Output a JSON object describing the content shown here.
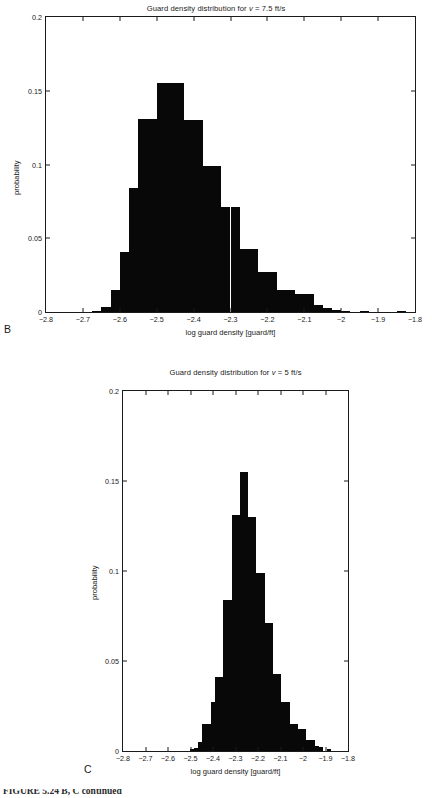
{
  "figure": {
    "caption_partial": "FIGURE 5.24  B, C continued"
  },
  "panels": [
    {
      "letter": "B",
      "title_prefix": "Guard density distribution for ",
      "title_var": "v",
      "title_suffix": " = 7.5 ft/s",
      "xlabel": "log guard density [guard/ft]",
      "ylabel": "probability"
    },
    {
      "letter": "C",
      "title_prefix": "Guard density distribution for ",
      "title_var": "v",
      "title_suffix": " = 5 ft/s",
      "xlabel": "log guard density [guard/ft]",
      "ylabel": "probability"
    }
  ],
  "chart_data": [
    {
      "type": "bar",
      "panel": "B",
      "title": "Guard density distribution for v = 7.5 ft/s",
      "xlabel": "log guard density [guard/ft]",
      "ylabel": "probability",
      "xlim": [
        -2.8,
        -1.8
      ],
      "ylim": [
        0,
        0.2
      ],
      "xticks": [
        -2.8,
        -2.7,
        -2.6,
        -2.5,
        -2.4,
        -2.3,
        -2.2,
        -2.1,
        -2.0,
        -1.9,
        -1.8
      ],
      "xtick_labels": [
        "−2.8",
        "−2.7",
        "−2.6",
        "−2.5",
        "−2.4",
        "−2.3",
        "−2.2",
        "−2.1",
        "−2",
        "−1.9",
        "−1.8"
      ],
      "yticks": [
        0,
        0.05,
        0.1,
        0.15,
        0.2
      ],
      "ytick_labels": [
        "0",
        "0.05",
        "0.1",
        "0.15",
        "0.2"
      ],
      "grid": false,
      "bin_width": 0.025,
      "bin_centers": [
        -2.6625,
        -2.6375,
        -2.6125,
        -2.5875,
        -2.5625,
        -2.5375,
        -2.5125,
        -2.4875,
        -2.4625,
        -2.4375,
        -2.4125,
        -2.3875,
        -2.3625,
        -2.3375,
        -2.3125,
        -2.2875,
        -2.2625,
        -2.2375,
        -2.2125,
        -2.1875,
        -2.1625,
        -2.1375,
        -2.1125,
        -2.0875,
        -2.0625,
        -2.0375,
        -2.0125,
        -1.9875,
        -1.9375,
        -1.8375
      ],
      "values": [
        0.001,
        0.0035,
        0.015,
        0.041,
        0.084,
        0.131,
        0.131,
        0.155,
        0.155,
        0.155,
        0.13,
        0.13,
        0.099,
        0.099,
        0.071,
        0.071,
        0.043,
        0.043,
        0.027,
        0.027,
        0.015,
        0.015,
        0.012,
        0.012,
        0.005,
        0.003,
        0.0015,
        0.001,
        0.0006,
        0.0004
      ]
    },
    {
      "type": "bar",
      "panel": "C",
      "title": "Guard density distribution for v = 5 ft/s",
      "xlabel": "log guard density [guard/ft]",
      "ylabel": "probability",
      "xlim": [
        -2.8,
        -1.8
      ],
      "ylim": [
        0,
        0.2
      ],
      "xticks": [
        -2.8,
        -2.7,
        -2.6,
        -2.5,
        -2.4,
        -2.3,
        -2.2,
        -2.1,
        -2.0,
        -1.9,
        -1.8
      ],
      "xtick_labels": [
        "−2.8",
        "−2.7",
        "−2.6",
        "−2.5",
        "−2.4",
        "−2.3",
        "−2.2",
        "−2.1",
        "−2",
        "−1.9",
        "−1.8"
      ],
      "yticks": [
        0,
        0.05,
        0.1,
        0.15,
        0.2
      ],
      "ytick_labels": [
        "0",
        "0.05",
        "0.1",
        "0.15",
        "0.2"
      ],
      "grid": false,
      "bin_width": 0.0185,
      "bin_centers": [
        -2.4935,
        -2.475,
        -2.4565,
        -2.438,
        -2.4195,
        -2.401,
        -2.3825,
        -2.364,
        -2.3455,
        -2.327,
        -2.3085,
        -2.29,
        -2.2715,
        -2.253,
        -2.2345,
        -2.216,
        -2.1975,
        -2.179,
        -2.1605,
        -2.142,
        -2.1235,
        -2.105,
        -2.0865,
        -2.068,
        -2.0495,
        -2.031,
        -2.0125,
        -1.994,
        -1.9755,
        -1.957,
        -1.9385,
        -1.92,
        -1.883
      ],
      "values": [
        0.0012,
        0.0018,
        0.005,
        0.015,
        0.015,
        0.027,
        0.041,
        0.041,
        0.084,
        0.084,
        0.131,
        0.131,
        0.155,
        0.155,
        0.13,
        0.13,
        0.099,
        0.099,
        0.071,
        0.071,
        0.043,
        0.043,
        0.027,
        0.027,
        0.015,
        0.015,
        0.012,
        0.012,
        0.006,
        0.006,
        0.003,
        0.002,
        0.001
      ]
    }
  ]
}
